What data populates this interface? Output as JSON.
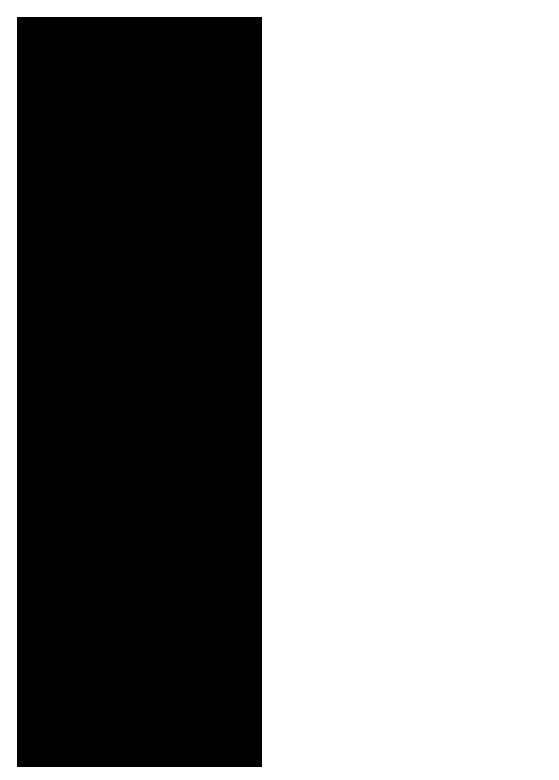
{
  "chart": {
    "background": "#000000",
    "foreground": "#ffffff"
  },
  "constellations": {
    "cepheus": "CEPHEUS",
    "ursa_minor_1": "URSA",
    "ursa_minor_2": "MINOR",
    "ursa_major": "URSA MAJOR",
    "draco": "DRACO",
    "cygnus": "CYGNUS",
    "lyra": "LYRA",
    "bootes": "BOOTES",
    "corona_1": "CORONA",
    "corona_2": "BOR.",
    "hercules": "HERCULES",
    "sagitta": "SAGITTA",
    "aquila": "AQUILA",
    "serpens_cauda": "SERPENS",
    "serpens_caput": "SERPENS",
    "ophiuchus": "OPHIUCHUS",
    "libra": "LIBRA",
    "sagittarius": "SAGITTARIUS",
    "scorpius": "SCORPIUS",
    "lupus": "LUPUS"
  },
  "named_stars": {
    "deneb": "Deneb",
    "vega": "Vega",
    "altair": "Altair",
    "arcturus": "Arcturus",
    "antares": "Antares",
    "cluster": "Cluster"
  },
  "greek": {
    "alpha": "α",
    "beta": "β",
    "gamma": "γ",
    "delta": "δ",
    "epsilon": "ϵ",
    "zeta": "ζ",
    "eta": "η",
    "theta": "θ",
    "lambda": "λ"
  },
  "declination_labels": [
    "80",
    "70",
    "60",
    "50",
    "40",
    "30",
    "20",
    "10",
    "0",
    "-10",
    "-20",
    "-30",
    "-40"
  ],
  "right_ascension_labels": [
    "20",
    "19",
    "18",
    "17",
    "16",
    "15",
    "14"
  ],
  "months": [
    "AUGUST",
    "JULY",
    "JUNE"
  ]
}
